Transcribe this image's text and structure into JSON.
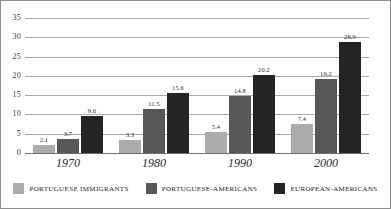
{
  "chart_data": {
    "type": "bar",
    "title": "",
    "subtitle": "",
    "xlabel": "",
    "ylabel": "",
    "ylim": [
      0,
      35
    ],
    "yticks": [
      "0",
      "5",
      "10",
      "15",
      "20",
      "25",
      "30",
      "35"
    ],
    "ytick_values": [
      0,
      5,
      10,
      15,
      20,
      25,
      30,
      35
    ],
    "grid": true,
    "legend_position": "bottom",
    "categories": [
      "1970",
      "1980",
      "1990",
      "2000"
    ],
    "series": [
      {
        "name": "PORTUGUESE IMMIGRANTS",
        "color": "#ababab",
        "values": [
          2.1,
          3.3,
          5.4,
          7.4
        ],
        "labels": [
          "2.1",
          "3.3",
          "5.4",
          "7.4"
        ]
      },
      {
        "name": "PORTUGUESE-AMERICANS",
        "color": "#58585a",
        "values": [
          3.7,
          11.5,
          14.8,
          19.2
        ],
        "labels": [
          "3.7",
          "11.5",
          "14.8",
          "19.2"
        ]
      },
      {
        "name": "EUROPEAN-AMERICANS",
        "color": "#242425",
        "values": [
          9.6,
          15.6,
          20.2,
          28.9
        ],
        "labels": [
          "9.6",
          "15.6",
          "20.2",
          "28.9"
        ]
      }
    ]
  }
}
